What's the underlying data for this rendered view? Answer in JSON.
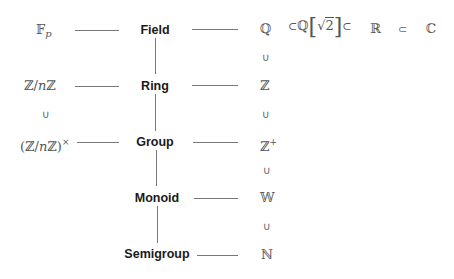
{
  "structures": {
    "field": "Field",
    "ring": "Ring",
    "group": "Group",
    "monoid": "Monoid",
    "semigroup": "Semigroup"
  },
  "left_examples": {
    "field": {
      "base": "𝔽",
      "sub": "p"
    },
    "ring": {
      "a": "ℤ",
      "slash": "/",
      "n": "n",
      "b": "ℤ"
    },
    "subset_symbol": "∪",
    "group": {
      "open": "(",
      "a": "ℤ",
      "slash": "/",
      "n": "n",
      "b": "ℤ",
      "close": ")",
      "sup": "×"
    }
  },
  "right_sets": {
    "rationals": "ℚ",
    "integers": "ℤ",
    "positive_integers": {
      "base": "ℤ",
      "sup": "+"
    },
    "wholes": "𝕎",
    "naturals": "ℕ",
    "subset_up": "∪"
  },
  "field_chain": {
    "subset": "⊂",
    "extension_base": "ℚ",
    "sqrt_sign": "√",
    "sqrt_arg": "2",
    "reals": "ℝ",
    "complex": "ℂ",
    "left_bracket": "[",
    "right_bracket": "]"
  }
}
